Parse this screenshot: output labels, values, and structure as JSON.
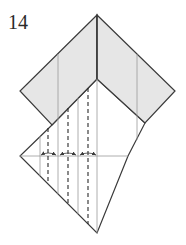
{
  "diagram": {
    "step_number": "14",
    "colors": {
      "paper_colored_side": "#e6e6e6",
      "paper_white_side": "#ffffff",
      "edge_line": "#3a3a3a",
      "crease_line": "#9a9a9a",
      "valley_fold_dash": "#2a2a2a",
      "arrow": "#3a3a3a"
    },
    "elements": [
      {
        "type": "gray-chevron-band",
        "desc": "colored side of paper forming inverted V on top"
      },
      {
        "type": "white-kite",
        "desc": "white side, lower kite-shaped region"
      },
      {
        "type": "valley-folds",
        "count": 3,
        "desc": "vertical dashed fold lines"
      },
      {
        "type": "pleat-arrows",
        "count": 3,
        "desc": "small double arrows along horizontal line indicating pleat folds"
      }
    ]
  }
}
